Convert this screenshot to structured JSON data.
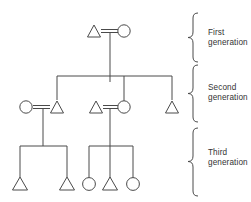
{
  "figure": {
    "type": "pedigree-chart",
    "title": "",
    "line_color": "#4a4a4a",
    "symbol_fill": "#ffffff",
    "background": "#ffffff"
  },
  "labels": {
    "first": "First\ngeneration",
    "second": "Second\ngeneration",
    "third": "Third\ngeneration"
  },
  "legend_semantics": {
    "triangle": "male",
    "circle": "female",
    "double_line": "mating / marriage",
    "vertical_line": "descent",
    "horizontal_line": "sibship"
  },
  "generations": [
    {
      "name": "first",
      "label": "First\ngeneration",
      "individuals": [
        {
          "id": "I-1",
          "symbol": "triangle",
          "x": 94,
          "y": 33
        },
        {
          "id": "I-2",
          "symbol": "circle",
          "x": 124,
          "y": 33
        }
      ],
      "matings": [
        {
          "id": "M-1",
          "partners": [
            "I-1",
            "I-2"
          ],
          "children": [
            "II-2",
            "II-4",
            "II-5"
          ]
        }
      ]
    },
    {
      "name": "second",
      "label": "Second\ngeneration",
      "individuals": [
        {
          "id": "II-1",
          "symbol": "circle",
          "x": 26,
          "y": 108
        },
        {
          "id": "II-2",
          "symbol": "triangle",
          "x": 57,
          "y": 108
        },
        {
          "id": "II-3",
          "symbol": "triangle",
          "x": 96,
          "y": 108
        },
        {
          "id": "II-4",
          "symbol": "circle",
          "x": 124,
          "y": 108
        },
        {
          "id": "II-5",
          "symbol": "triangle",
          "x": 172,
          "y": 108
        }
      ],
      "matings": [
        {
          "id": "M-2",
          "partners": [
            "II-1",
            "II-2"
          ],
          "children": [
            "III-1",
            "III-2"
          ]
        },
        {
          "id": "M-3",
          "partners": [
            "II-3",
            "II-4"
          ],
          "children": [
            "III-3",
            "III-4",
            "III-5"
          ]
        }
      ]
    },
    {
      "name": "third",
      "label": "Third\ngeneration",
      "individuals": [
        {
          "id": "III-1",
          "symbol": "triangle",
          "x": 25,
          "y": 184
        },
        {
          "id": "III-2",
          "symbol": "triangle",
          "x": 67,
          "y": 184
        },
        {
          "id": "III-3",
          "symbol": "circle",
          "x": 105,
          "y": 184
        },
        {
          "id": "III-4",
          "symbol": "triangle",
          "x": 127,
          "y": 184
        },
        {
          "id": "III-5",
          "symbol": "circle",
          "x": 150,
          "y": 184
        }
      ],
      "matings": []
    }
  ],
  "braces": [
    {
      "id": "brace-first",
      "top": 13,
      "bottom": 62,
      "x": 192
    },
    {
      "id": "brace-second",
      "top": 65,
      "bottom": 122,
      "x": 192
    },
    {
      "id": "brace-third",
      "top": 128,
      "bottom": 196,
      "x": 192
    }
  ]
}
